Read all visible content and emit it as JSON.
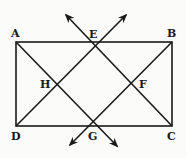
{
  "diagram": {
    "points": [
      {
        "name": "A",
        "label": "A"
      },
      {
        "name": "B",
        "label": "B"
      },
      {
        "name": "C",
        "label": "C"
      },
      {
        "name": "D",
        "label": "D"
      },
      {
        "name": "E",
        "label": "E"
      },
      {
        "name": "F",
        "label": "F"
      },
      {
        "name": "G",
        "label": "G"
      },
      {
        "name": "H",
        "label": "H"
      }
    ],
    "segments": [
      "AB",
      "BC",
      "CD",
      "DA",
      "AG",
      "EC",
      "DE",
      "BG"
    ],
    "rays": [
      "E-up-left",
      "E-up-right",
      "G-down-left",
      "G-down-right"
    ],
    "colors": {
      "stroke": "#1a1a1a",
      "background": "#fbfbfa"
    }
  }
}
